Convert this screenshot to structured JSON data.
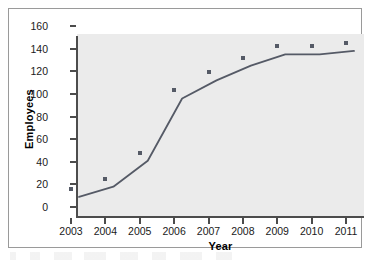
{
  "chart_data": {
    "type": "line",
    "title": "",
    "xlabel": "Year",
    "ylabel": "Employees",
    "categories": [
      "2003",
      "2004",
      "2005",
      "2006",
      "2007",
      "2008",
      "2009",
      "2010",
      "2011"
    ],
    "x": [
      2003,
      2004,
      2005,
      2006,
      2007,
      2008,
      2009,
      2010,
      2011
    ],
    "values": [
      16,
      25,
      48,
      103,
      119,
      132,
      142,
      142,
      145
    ],
    "series": [
      {
        "name": "Employees",
        "values": [
          16,
          25,
          48,
          103,
          119,
          132,
          142,
          142,
          145
        ]
      }
    ],
    "xlim": [
      2002.5,
      2011.5
    ],
    "ylim": [
      0,
      160
    ],
    "yticks": [
      0,
      20,
      40,
      60,
      80,
      100,
      120,
      140,
      160
    ],
    "ytick_labels": [
      "0",
      "20",
      "40",
      "60",
      "80",
      "100",
      "120",
      "140",
      "160"
    ],
    "xticks": [
      2003,
      2004,
      2005,
      2006,
      2007,
      2008,
      2009,
      2010,
      2011
    ],
    "xtick_labels": [
      "2003",
      "2004",
      "2005",
      "2006",
      "2007",
      "2008",
      "2009",
      "2010",
      "2011"
    ],
    "grid": false,
    "legend": null,
    "legend_position": "none",
    "marker": "square",
    "colors": {
      "series_line": "#555a66",
      "series_marker": "#555a66",
      "panel_background": "#ebebeb",
      "figure_background": "#ffffff",
      "axis": "#4c4c4c",
      "frame_border": "#9a9a9a",
      "tick_label": "#1a1a1a",
      "axis_label": "#000000"
    }
  }
}
